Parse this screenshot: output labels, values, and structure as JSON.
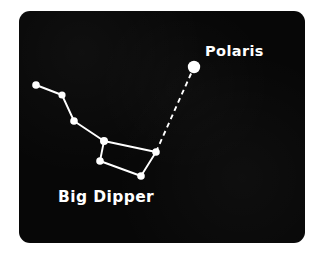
{
  "card": {
    "background_color": "#070707",
    "page_background_color": "#ffffff",
    "star_color": "#ffffff",
    "line_color": "#ffffff",
    "x": 19,
    "y": 11,
    "width": 286,
    "height": 232,
    "corner_radius": 11
  },
  "labels": {
    "polaris": "Polaris",
    "big_dipper": "Big Dipper"
  },
  "chart_data": {
    "type": "scatter",
    "xlabel": "",
    "ylabel": "",
    "xlim": [
      0,
      286
    ],
    "ylim": [
      0,
      232
    ],
    "grid": false,
    "legend": "none",
    "note": "Coordinates are in card-local pixels (card origin 19,11 on the 325x255 page); y increases downward.",
    "stars": [
      {
        "name": "Alkaid",
        "label": "",
        "x": 17,
        "y": 74,
        "radius": 3.8,
        "group": "big-dipper-handle"
      },
      {
        "name": "Mizar",
        "label": "",
        "x": 43,
        "y": 84,
        "radius": 3.6,
        "group": "big-dipper-handle"
      },
      {
        "name": "Alioth",
        "label": "",
        "x": 55,
        "y": 110,
        "radius": 3.8,
        "group": "big-dipper-handle"
      },
      {
        "name": "Megrez",
        "label": "",
        "x": 85,
        "y": 130,
        "radius": 4.0,
        "group": "big-dipper-bowl"
      },
      {
        "name": "Merak",
        "label": "",
        "x": 81,
        "y": 150,
        "radius": 3.8,
        "group": "big-dipper-bowl"
      },
      {
        "name": "Phecda",
        "label": "",
        "x": 122,
        "y": 165,
        "radius": 3.8,
        "group": "big-dipper-bowl"
      },
      {
        "name": "Dubhe",
        "label": "",
        "x": 137,
        "y": 141,
        "radius": 3.8,
        "group": "big-dipper-bowl"
      },
      {
        "name": "Polaris",
        "label": "Polaris",
        "x": 175,
        "y": 56,
        "radius": 6.2,
        "group": "pole-star"
      }
    ],
    "solid_lines": [
      {
        "from": "Alkaid",
        "to": "Mizar",
        "x1": 17,
        "y1": 74,
        "x2": 43,
        "y2": 84
      },
      {
        "from": "Mizar",
        "to": "Alioth",
        "x1": 43,
        "y1": 84,
        "x2": 55,
        "y2": 110
      },
      {
        "from": "Alioth",
        "to": "Megrez",
        "x1": 55,
        "y1": 110,
        "x2": 85,
        "y2": 130
      },
      {
        "from": "Megrez",
        "to": "Dubhe",
        "x1": 85,
        "y1": 130,
        "x2": 137,
        "y2": 141
      },
      {
        "from": "Megrez",
        "to": "Merak",
        "x1": 85,
        "y1": 130,
        "x2": 81,
        "y2": 150
      },
      {
        "from": "Merak",
        "to": "Phecda",
        "x1": 81,
        "y1": 150,
        "x2": 122,
        "y2": 165
      },
      {
        "from": "Phecda",
        "to": "Dubhe",
        "x1": 122,
        "y1": 165,
        "x2": 137,
        "y2": 141
      }
    ],
    "dashed_lines": [
      {
        "from": "Dubhe",
        "to": "Polaris",
        "x1": 137,
        "y1": 141,
        "x2": 175,
        "y2": 56,
        "dash": "5 4"
      }
    ],
    "line_width": 1.9
  }
}
